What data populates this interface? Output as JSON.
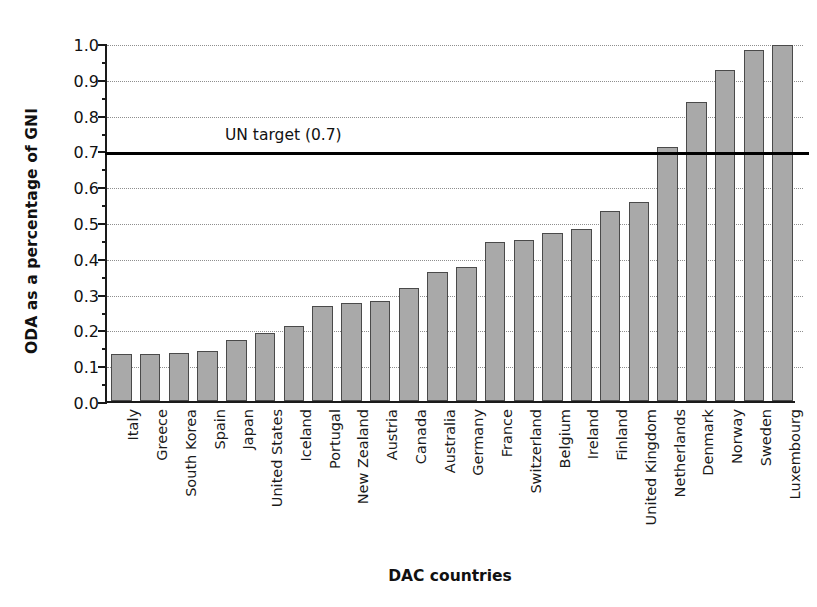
{
  "chart_data": {
    "type": "bar",
    "title": "",
    "xlabel": "DAC countries",
    "ylabel": "ODA as a percentage of GNI",
    "ylim": [
      0.0,
      1.0
    ],
    "ytick_labels": [
      "0.0",
      "0.1",
      "0.2",
      "0.3",
      "0.4",
      "0.5",
      "0.6",
      "0.7",
      "0.8",
      "0.9",
      "1.0"
    ],
    "ytick_values": [
      0.0,
      0.1,
      0.2,
      0.3,
      0.4,
      0.5,
      0.6,
      0.7,
      0.8,
      0.9,
      1.0
    ],
    "grid": "horizontal-dotted",
    "legend": "none",
    "bar_color": "#a9a9a9",
    "bar_edge_color": "#4a4a4a",
    "axis_color": "#1a1a1a",
    "categories": [
      "Italy",
      "Greece",
      "South Korea",
      "Spain",
      "Japan",
      "United States",
      "Iceland",
      "Portugal",
      "New Zealand",
      "Austria",
      "Canada",
      "Australia",
      "Germany",
      "France",
      "Switzerland",
      "Belgium",
      "Ireland",
      "Finland",
      "United Kingdom",
      "Netherlands",
      "Denmark",
      "Norway",
      "Sweden",
      "Luxembourg"
    ],
    "values": [
      0.13,
      0.13,
      0.135,
      0.14,
      0.17,
      0.19,
      0.21,
      0.265,
      0.275,
      0.28,
      0.315,
      0.36,
      0.375,
      0.445,
      0.45,
      0.47,
      0.48,
      0.53,
      0.555,
      0.71,
      0.835,
      0.925,
      0.98,
      0.995
    ],
    "annotations": [
      {
        "name": "un-target",
        "label": "UN target (0.7)",
        "value": 0.7,
        "line_color": "#000000",
        "style": "horizontal-solid"
      }
    ]
  }
}
